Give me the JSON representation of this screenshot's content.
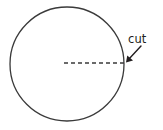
{
  "figure": {
    "name": "circle-with-cut-radius",
    "background_color": "#ffffff",
    "stroke_color": "#3a3a3a",
    "text_color": "#231f20",
    "circle": {
      "center_x": 67,
      "center_y": 64,
      "radius": 57,
      "stroke_width": 1.3,
      "fill": "none"
    },
    "cut_line": {
      "style": "dashed",
      "dash_pattern": "4,3",
      "x1": 64,
      "y1": 63,
      "x2": 124,
      "y2": 63,
      "stroke_width": 1.3
    },
    "arrow": {
      "tail_x": 141,
      "tail_y": 46,
      "tip_x": 126,
      "tip_y": 62,
      "stroke_width": 1.4,
      "head_size": 5
    },
    "labels": {
      "cut": "cut"
    },
    "label_positions": {
      "cut_x": 128,
      "cut_y": 43
    }
  }
}
